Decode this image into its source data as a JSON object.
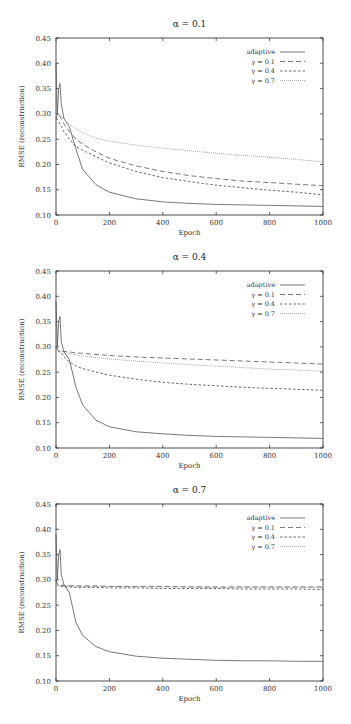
{
  "chart_data": [
    {
      "type": "line",
      "title": "α = 0.1",
      "xlabel": "Epoch",
      "ylabel": "RMSE (reconstruction)",
      "xlim": [
        0,
        1000
      ],
      "ylim": [
        0.1,
        0.45
      ],
      "xticks": [
        0,
        200,
        400,
        600,
        800,
        1000
      ],
      "yticks": [
        0.1,
        0.15,
        0.2,
        0.25,
        0.3,
        0.35,
        0.4,
        0.45
      ],
      "grid": false,
      "legend_position": "upper right",
      "x": [
        0,
        5,
        10,
        15,
        20,
        30,
        50,
        75,
        100,
        150,
        200,
        300,
        400,
        500,
        600,
        700,
        800,
        900,
        1000
      ],
      "series": [
        {
          "name": "adaptive",
          "style": "solid",
          "values": [
            0.4,
            0.3,
            0.35,
            0.36,
            0.32,
            0.29,
            0.275,
            0.23,
            0.19,
            0.16,
            0.145,
            0.132,
            0.126,
            0.123,
            0.121,
            0.12,
            0.119,
            0.118,
            0.117
          ]
        },
        {
          "name": "γ = 0.1",
          "style": "dashed",
          "values": [
            0.29,
            0.3,
            0.3,
            0.295,
            0.29,
            0.28,
            0.265,
            0.25,
            0.24,
            0.225,
            0.212,
            0.197,
            0.186,
            0.178,
            0.172,
            0.167,
            0.164,
            0.161,
            0.158
          ]
        },
        {
          "name": "γ = 0.4",
          "style": "short-dashed",
          "values": [
            0.29,
            0.29,
            0.285,
            0.28,
            0.275,
            0.265,
            0.25,
            0.235,
            0.228,
            0.215,
            0.203,
            0.186,
            0.174,
            0.166,
            0.159,
            0.154,
            0.149,
            0.145,
            0.14
          ]
        },
        {
          "name": "γ = 0.7",
          "style": "dotted",
          "values": [
            0.3,
            0.3,
            0.3,
            0.297,
            0.295,
            0.29,
            0.28,
            0.27,
            0.262,
            0.252,
            0.246,
            0.238,
            0.232,
            0.227,
            0.222,
            0.218,
            0.214,
            0.21,
            0.205
          ]
        }
      ]
    },
    {
      "type": "line",
      "title": "α = 0.4",
      "xlabel": "Epoch",
      "ylabel": "RMSE (reconstruction)",
      "xlim": [
        0,
        1000
      ],
      "ylim": [
        0.1,
        0.45
      ],
      "xticks": [
        0,
        200,
        400,
        600,
        800,
        1000
      ],
      "yticks": [
        0.1,
        0.15,
        0.2,
        0.25,
        0.3,
        0.35,
        0.4,
        0.45
      ],
      "grid": false,
      "legend_position": "upper right",
      "x": [
        0,
        5,
        10,
        15,
        20,
        30,
        50,
        75,
        100,
        150,
        200,
        300,
        400,
        500,
        600,
        700,
        800,
        900,
        1000
      ],
      "series": [
        {
          "name": "adaptive",
          "style": "solid",
          "values": [
            0.39,
            0.3,
            0.35,
            0.36,
            0.31,
            0.29,
            0.275,
            0.22,
            0.185,
            0.155,
            0.142,
            0.132,
            0.128,
            0.125,
            0.123,
            0.122,
            0.121,
            0.12,
            0.119
          ]
        },
        {
          "name": "γ = 0.1",
          "style": "dashed",
          "values": [
            0.3,
            0.295,
            0.293,
            0.292,
            0.292,
            0.291,
            0.29,
            0.288,
            0.287,
            0.285,
            0.283,
            0.28,
            0.278,
            0.276,
            0.274,
            0.272,
            0.27,
            0.268,
            0.266
          ]
        },
        {
          "name": "γ = 0.4",
          "style": "short-dashed",
          "values": [
            0.3,
            0.295,
            0.29,
            0.29,
            0.288,
            0.28,
            0.27,
            0.262,
            0.257,
            0.25,
            0.244,
            0.236,
            0.23,
            0.226,
            0.223,
            0.22,
            0.218,
            0.216,
            0.214
          ]
        },
        {
          "name": "γ = 0.7",
          "style": "dotted",
          "values": [
            0.3,
            0.295,
            0.292,
            0.291,
            0.29,
            0.289,
            0.287,
            0.284,
            0.282,
            0.279,
            0.276,
            0.272,
            0.268,
            0.265,
            0.262,
            0.259,
            0.256,
            0.254,
            0.252
          ]
        }
      ]
    },
    {
      "type": "line",
      "title": "α = 0.7",
      "xlabel": "Epoch",
      "ylabel": "RMSE (reconstruction)",
      "xlim": [
        0,
        1000
      ],
      "ylim": [
        0.1,
        0.45
      ],
      "xticks": [
        0,
        200,
        400,
        600,
        800,
        1000
      ],
      "yticks": [
        0.1,
        0.15,
        0.2,
        0.25,
        0.3,
        0.35,
        0.4,
        0.45
      ],
      "grid": false,
      "legend_position": "upper right",
      "x": [
        0,
        5,
        10,
        15,
        20,
        30,
        50,
        75,
        100,
        150,
        200,
        300,
        400,
        500,
        600,
        700,
        800,
        900,
        1000
      ],
      "series": [
        {
          "name": "adaptive",
          "style": "solid",
          "values": [
            0.39,
            0.3,
            0.35,
            0.36,
            0.31,
            0.29,
            0.275,
            0.215,
            0.19,
            0.168,
            0.158,
            0.149,
            0.145,
            0.143,
            0.141,
            0.14,
            0.14,
            0.139,
            0.139
          ]
        },
        {
          "name": "γ = 0.1",
          "style": "dashed",
          "values": [
            0.3,
            0.292,
            0.29,
            0.289,
            0.289,
            0.289,
            0.288,
            0.288,
            0.288,
            0.288,
            0.287,
            0.287,
            0.287,
            0.286,
            0.286,
            0.286,
            0.286,
            0.286,
            0.286
          ]
        },
        {
          "name": "γ = 0.4",
          "style": "short-dashed",
          "values": [
            0.3,
            0.29,
            0.288,
            0.287,
            0.287,
            0.286,
            0.286,
            0.285,
            0.285,
            0.285,
            0.284,
            0.284,
            0.283,
            0.283,
            0.283,
            0.282,
            0.282,
            0.282,
            0.281
          ]
        },
        {
          "name": "γ = 0.7",
          "style": "dotted",
          "values": [
            0.3,
            0.292,
            0.29,
            0.289,
            0.289,
            0.288,
            0.288,
            0.288,
            0.287,
            0.287,
            0.287,
            0.286,
            0.286,
            0.286,
            0.285,
            0.285,
            0.285,
            0.285,
            0.285
          ]
        }
      ]
    }
  ],
  "panels": [
    {
      "title": "α = 0.1",
      "xlabel": "Epoch",
      "ylabel": "RMSE (reconstruction)"
    },
    {
      "title": "α = 0.4",
      "xlabel": "Epoch",
      "ylabel": "RMSE (reconstruction)"
    },
    {
      "title": "α = 0.7",
      "xlabel": "Epoch",
      "ylabel": "RMSE (reconstruction)"
    }
  ],
  "legend": [
    "adaptive",
    "γ = 0.1",
    "γ = 0.4",
    "γ = 0.7"
  ],
  "colors": {
    "axis": "#222222",
    "line": "#444444",
    "faint": "#888888"
  }
}
